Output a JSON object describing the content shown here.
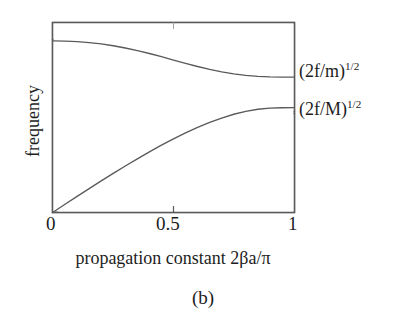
{
  "figure": {
    "caption": "(b)",
    "background_color": "#ffffff",
    "line_color": "#555555",
    "text_color": "#1d1d1d"
  },
  "axes": {
    "x_title": "propagation constant 2βa/π",
    "y_title": "frequency",
    "x_tick_labels": [
      "0",
      "0.5",
      "1"
    ],
    "y_tick_labels": []
  },
  "annotations": {
    "optical": {
      "base": "(2f/m)",
      "exponent": "1/2"
    },
    "acoustic": {
      "base": "(2f/M)",
      "exponent": "1/2"
    }
  },
  "chart_data": {
    "type": "line",
    "title": "",
    "xlabel": "propagation constant 2βa/π",
    "ylabel": "frequency",
    "xlim": [
      0,
      1
    ],
    "ylim": [
      0,
      1
    ],
    "xticks": [
      0,
      0.5,
      1
    ],
    "xticklabels": [
      "0",
      "0.5",
      "1"
    ],
    "yticks": [],
    "grid": false,
    "legend": "none",
    "frame": "box",
    "series": [
      {
        "name": "optical branch",
        "annotation": "(2f/m)^1/2",
        "x": [
          0.0,
          0.05,
          0.1,
          0.15,
          0.2,
          0.25,
          0.3,
          0.35,
          0.4,
          0.45,
          0.5,
          0.55,
          0.6,
          0.65,
          0.7,
          0.75,
          0.8,
          0.85,
          0.9,
          0.95,
          1.0
        ],
        "y": [
          0.908,
          0.907,
          0.904,
          0.899,
          0.892,
          0.882,
          0.87,
          0.856,
          0.841,
          0.824,
          0.806,
          0.789,
          0.772,
          0.757,
          0.744,
          0.733,
          0.725,
          0.72,
          0.717,
          0.716,
          0.716
        ]
      },
      {
        "name": "acoustic branch",
        "annotation": "(2f/M)^1/2",
        "x": [
          0.0,
          0.05,
          0.1,
          0.15,
          0.2,
          0.25,
          0.3,
          0.35,
          0.4,
          0.45,
          0.5,
          0.55,
          0.6,
          0.65,
          0.7,
          0.75,
          0.8,
          0.85,
          0.9,
          0.95,
          1.0
        ],
        "y": [
          0.0,
          0.042,
          0.084,
          0.125,
          0.166,
          0.206,
          0.245,
          0.283,
          0.32,
          0.355,
          0.389,
          0.42,
          0.449,
          0.476,
          0.499,
          0.519,
          0.5345,
          0.5455,
          0.5515,
          0.5535,
          0.554
        ]
      }
    ]
  }
}
